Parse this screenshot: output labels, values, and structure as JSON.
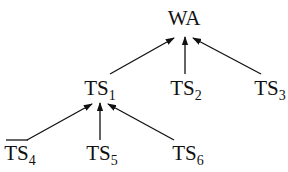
{
  "diagram": {
    "type": "tree",
    "root": "WA",
    "nodes": [
      {
        "id": "WA",
        "base": "WA",
        "sub": "",
        "x": 184,
        "y": 7
      },
      {
        "id": "TS1",
        "base": "TS",
        "sub": "1",
        "x": 100,
        "y": 77
      },
      {
        "id": "TS2",
        "base": "TS",
        "sub": "2",
        "x": 186,
        "y": 77
      },
      {
        "id": "TS3",
        "base": "TS",
        "sub": "3",
        "x": 270,
        "y": 77
      },
      {
        "id": "TS4",
        "base": "TS",
        "sub": "4",
        "x": 20,
        "y": 142
      },
      {
        "id": "TS5",
        "base": "TS",
        "sub": "5",
        "x": 102,
        "y": 142
      },
      {
        "id": "TS6",
        "base": "TS",
        "sub": "6",
        "x": 188,
        "y": 142
      }
    ],
    "edges": [
      {
        "from": "TS1",
        "to": "WA"
      },
      {
        "from": "TS2",
        "to": "WA"
      },
      {
        "from": "TS3",
        "to": "WA"
      },
      {
        "from": "TS4",
        "to": "TS1"
      },
      {
        "from": "TS5",
        "to": "TS1"
      },
      {
        "from": "TS6",
        "to": "TS1"
      }
    ],
    "colors": {
      "line": "#111111",
      "text": "#111111",
      "background": "#ffffff"
    }
  }
}
